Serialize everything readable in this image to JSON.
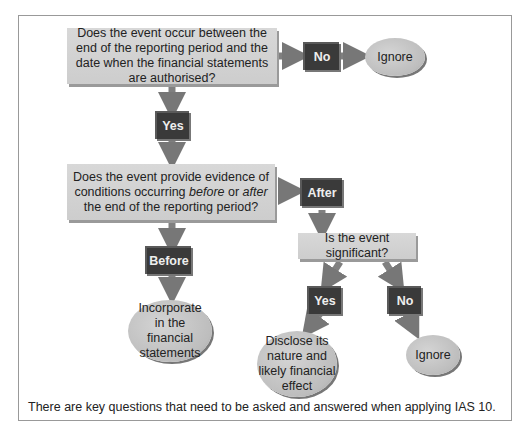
{
  "nodes": {
    "q1": "Does the event occur between the end of the reporting period and the date when the financial statements are authorised?",
    "no1": "No",
    "ignore1": "Ignore",
    "yes1": "Yes",
    "q2_pre": "Does the event provide evidence of conditions occurring ",
    "q2_before": "before",
    "q2_or": " or ",
    "q2_after": "after",
    "q2_post": " the end of the reporting period?",
    "after": "After",
    "before": "Before",
    "incorporate": "Incorporate in the financial statements",
    "q3": "Is the event significant?",
    "yes2": "Yes",
    "no2": "No",
    "disclose": "Disclose its nature and likely financial effect",
    "ignore2": "Ignore"
  },
  "caption": "There are key questions that need to be asked and answered when applying IAS 10.",
  "colors": {
    "arrow": "#7a7a7a",
    "label_box": "#3a3a3a",
    "question_box": "#d3d3d3"
  }
}
